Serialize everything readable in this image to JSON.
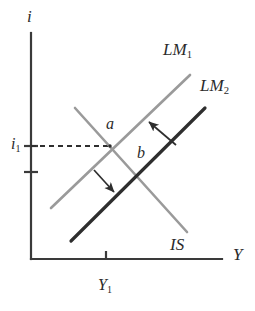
{
  "figure": {
    "type": "is-lm-diagram",
    "width": 255,
    "height": 311,
    "background": "#ffffff"
  },
  "axes": {
    "y_axis": {
      "label": "i",
      "label_text": "i",
      "x": 31,
      "y_top": 33,
      "y_bottom": 259,
      "color": "#3a3a3a"
    },
    "x_axis": {
      "label": "Y",
      "label_text": "Y",
      "y": 259,
      "x_left": 31,
      "x_right": 222,
      "color": "#3a3a3a"
    }
  },
  "ticks": {
    "y_ticks": [
      {
        "name": "i1-tick",
        "value": "i",
        "sub": "1",
        "y": 146,
        "labeled": true
      },
      {
        "name": "i2-tick",
        "value": "",
        "sub": "",
        "y": 172,
        "labeled": false
      }
    ],
    "x_ticks": [
      {
        "name": "Y1-tick",
        "value": "Y",
        "sub": "1",
        "x": 106,
        "labeled": true
      }
    ]
  },
  "tick_labels": {
    "i1": {
      "base": "i",
      "sub": "1"
    },
    "Y1": {
      "base": "Y",
      "sub": "1"
    }
  },
  "curves": [
    {
      "name": "LM1",
      "base": "LM",
      "sub": "1",
      "color": "#9a9a9a",
      "width": 2.6,
      "x1": 51,
      "y1": 208,
      "x2": 190,
      "y2": 75,
      "label_x": 183,
      "label_y": 52
    },
    {
      "name": "LM2",
      "base": "LM",
      "sub": "2",
      "color": "#2e2e2e",
      "width": 3.2,
      "x1": 71,
      "y1": 241,
      "x2": 205,
      "y2": 108,
      "label_x": 220,
      "label_y": 88
    },
    {
      "name": "IS",
      "base": "IS",
      "sub": "",
      "color": "#9a9a9a",
      "width": 2.6,
      "x1": 75,
      "y1": 108,
      "x2": 187,
      "y2": 232,
      "label_x": 190,
      "label_y": 247
    }
  ],
  "points": [
    {
      "name": "a",
      "label": "a",
      "x": 110,
      "y": 146,
      "label_x": 106,
      "label_y": 127
    },
    {
      "name": "b",
      "label": "b",
      "x": 141,
      "y": 176,
      "label_x": 137,
      "label_y": 156
    }
  ],
  "guides": {
    "dashed_line": {
      "name": "i1-guide",
      "x1": 31,
      "y1": 146,
      "x2": 110,
      "y2": 146,
      "dash": "5,4",
      "color": "#2e2e2e"
    }
  },
  "arrows": [
    {
      "name": "shift-arrow-upper",
      "x1": 176,
      "y1": 145,
      "x2": 149,
      "y2": 122,
      "color": "#2e2e2e",
      "direction": "up-left"
    },
    {
      "name": "shift-arrow-lower",
      "x1": 94,
      "y1": 170,
      "x2": 114,
      "y2": 192,
      "color": "#2e2e2e",
      "direction": "down-right"
    }
  ],
  "chart_data": {
    "type": "line",
    "title": "",
    "xlabel": "Y",
    "ylabel": "i",
    "grid": false,
    "legend": "inline-curve-labels",
    "series": [
      {
        "name": "LM1",
        "label": "LM₁",
        "color": "#9a9a9a",
        "slope": "positive"
      },
      {
        "name": "LM2",
        "label": "LM₂",
        "color": "#2e2e2e",
        "slope": "positive"
      },
      {
        "name": "IS",
        "label": "IS",
        "color": "#9a9a9a",
        "slope": "negative"
      }
    ],
    "annotations": [
      {
        "text": "a",
        "note": "equilibrium of IS and LM1"
      },
      {
        "text": "b",
        "note": "equilibrium of IS and LM2"
      },
      {
        "text": "i₁",
        "note": "interest rate at point a"
      },
      {
        "text": "Y₁",
        "note": "output at point a"
      }
    ]
  }
}
